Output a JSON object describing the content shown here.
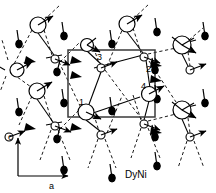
{
  "figure": {
    "caption": "DyNi",
    "type": "crystal-magnetic-structure-projection",
    "axes": {
      "vertical_label": "c",
      "horizontal_label": "a"
    },
    "site_labels": [
      "1",
      "2",
      "3",
      "4"
    ],
    "colors": {
      "stroke": "#000000",
      "fill_open": "#ffffff",
      "fill_solid": "#000000",
      "cell_box": "#333333",
      "background": "#ffffff"
    },
    "legend_semantics": {
      "large_open_circle": "Dy atom in plane",
      "small_open_circle": "Dy atom shifted along b",
      "solid_small_circle": "Ni atom",
      "arrow": "magnetic moment direction",
      "dashed_line": "out-of-plane bond projection",
      "solid_line": "in-plane bond",
      "rectangle": "unit cell"
    },
    "unit_cell_rect": {
      "x": 68,
      "y": 50,
      "width": 87,
      "height": 67
    },
    "atoms": {
      "dy_large": [
        {
          "cx": 38,
          "cy": 25,
          "r": 8,
          "mx": 17,
          "my": -9
        },
        {
          "cx": 127,
          "cy": 24,
          "r": 8,
          "mx": 17,
          "my": -9
        },
        {
          "cx": 182,
          "cy": 45,
          "r": 9,
          "mx": 16,
          "my": 9
        },
        {
          "cx": 37,
          "cy": 91,
          "r": 8,
          "mx": 17,
          "my": -9
        },
        {
          "cx": 87,
          "cy": 45,
          "r": 6,
          "mx": 15,
          "my": 8
        },
        {
          "cx": 149,
          "cy": 94,
          "r": 7,
          "mx": 16,
          "my": -9
        },
        {
          "cx": 86,
          "cy": 112,
          "r": 8,
          "mx": 17,
          "my": 8
        },
        {
          "cx": 182,
          "cy": 110,
          "r": 9,
          "mx": 16,
          "my": 9
        }
      ],
      "dy_small": [
        {
          "cx": 55,
          "cy": 59,
          "r": 4,
          "mx": 16,
          "my": 6
        },
        {
          "cx": 101,
          "cy": 68,
          "r": 4,
          "mx": 17,
          "my": -5
        },
        {
          "cx": 144,
          "cy": 57,
          "r": 4,
          "mx": 17,
          "my": 6
        },
        {
          "cx": 55,
          "cy": 126,
          "r": 4,
          "mx": 16,
          "my": 6
        },
        {
          "cx": 101,
          "cy": 135,
          "r": 4,
          "mx": 17,
          "my": -5
        },
        {
          "cx": 144,
          "cy": 124,
          "r": 4,
          "mx": 17,
          "my": 6
        },
        {
          "cx": 190,
          "cy": 70,
          "r": 4,
          "mx": 17,
          "my": -5
        },
        {
          "cx": 190,
          "cy": 137,
          "r": 4,
          "mx": 17,
          "my": -5
        },
        {
          "cx": 9,
          "cy": 70,
          "r": 4,
          "mx": 16,
          "my": -5
        }
      ],
      "ni_solid": [
        {
          "cx": 64,
          "cy": 36,
          "tx": 62,
          "ty": 22
        },
        {
          "cx": 112,
          "cy": 44,
          "tx": 110,
          "ty": 30
        },
        {
          "cx": 157,
          "cy": 32,
          "tx": 155,
          "ty": 18
        },
        {
          "cx": 64,
          "cy": 103,
          "tx": 62,
          "ty": 89
        },
        {
          "cx": 112,
          "cy": 111,
          "tx": 110,
          "ty": 97
        },
        {
          "cx": 157,
          "cy": 99,
          "tx": 155,
          "ty": 85
        },
        {
          "cx": 64,
          "cy": 170,
          "tx": 62,
          "ty": 156
        },
        {
          "cx": 112,
          "cy": 178,
          "tx": 110,
          "ty": 164
        },
        {
          "cx": 157,
          "cy": 166,
          "tx": 155,
          "ty": 152
        },
        {
          "cx": 19,
          "cy": 112,
          "tx": 17,
          "ty": 98
        }
      ]
    },
    "label_positions": [
      {
        "text": "1",
        "x": 79,
        "y": 105
      },
      {
        "text": "2",
        "x": 146,
        "y": 72
      },
      {
        "text": "3",
        "x": 97,
        "y": 60
      },
      {
        "text": "4",
        "x": 141,
        "y": 89
      }
    ],
    "axis_origin": {
      "x": 18,
      "y": 176
    },
    "axis_c_tip": {
      "x": 18,
      "y": 136
    },
    "axis_a_tip": {
      "x": 70,
      "y": 176
    },
    "caption_position": {
      "x": 125,
      "y": 176
    }
  }
}
